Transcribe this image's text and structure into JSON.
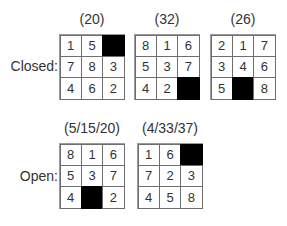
{
  "rows": [
    {
      "label": "Closed:",
      "puzzles": [
        {
          "caption": "(20)",
          "cells": [
            "1",
            "5",
            "",
            "7",
            "8",
            "3",
            "4",
            "6",
            "2"
          ]
        },
        {
          "caption": "(32)",
          "cells": [
            "8",
            "1",
            "6",
            "5",
            "3",
            "7",
            "4",
            "2",
            ""
          ]
        },
        {
          "caption": "(26)",
          "cells": [
            "2",
            "1",
            "7",
            "3",
            "4",
            "6",
            "5",
            "",
            "8"
          ]
        }
      ]
    },
    {
      "label": "Open:",
      "puzzles": [
        {
          "caption": "(5/15/20)",
          "cells": [
            "8",
            "1",
            "6",
            "5",
            "3",
            "7",
            "4",
            "",
            "2"
          ]
        },
        {
          "caption": "(4/33/37)",
          "cells": [
            "1",
            "6",
            "",
            "7",
            "2",
            "3",
            "4",
            "5",
            "8"
          ]
        }
      ]
    }
  ]
}
